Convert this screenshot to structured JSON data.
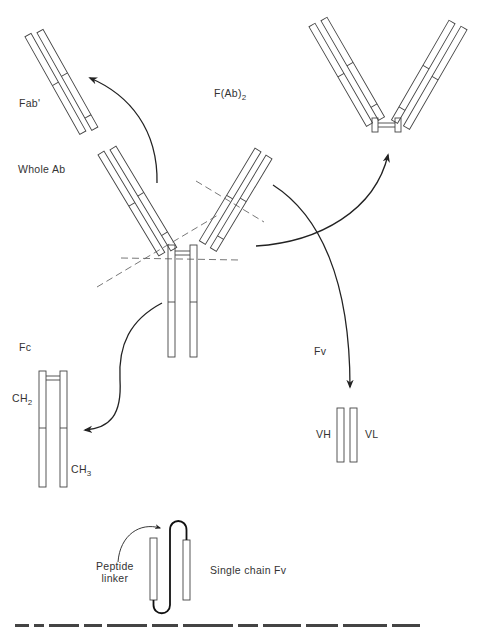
{
  "diagram": {
    "labels": {
      "fab_prime": "Fab'",
      "fab2_main": "F(Ab)",
      "fab2_sub": "2",
      "whole_ab": "Whole Ab",
      "fc": "Fc",
      "ch2_main": "CH",
      "ch2_sub": "2",
      "ch3_main": "CH",
      "ch3_sub": "3",
      "fv": "Fv",
      "vh": "VH",
      "vl": "VL",
      "peptide_linker_line1": "Peptide",
      "peptide_linker_line2": "linker",
      "single_chain_fv": "Single chain Fv"
    },
    "nodes": [
      {
        "id": "whole_ab",
        "label": "Whole Ab"
      },
      {
        "id": "fab_prime",
        "label": "Fab'"
      },
      {
        "id": "fab2",
        "label": "F(Ab)2"
      },
      {
        "id": "fc",
        "label": "Fc",
        "domains": [
          "CH2",
          "CH3"
        ]
      },
      {
        "id": "fv",
        "label": "Fv",
        "domains": [
          "VH",
          "VL"
        ]
      },
      {
        "id": "scfv",
        "label": "Single chain Fv",
        "annotation": "Peptide linker"
      }
    ],
    "edges": [
      {
        "from": "whole_ab",
        "to": "fab_prime"
      },
      {
        "from": "whole_ab",
        "to": "fab2"
      },
      {
        "from": "whole_ab",
        "to": "fc"
      },
      {
        "from": "whole_ab",
        "to": "fv"
      }
    ],
    "colors": {
      "stroke": "#333333",
      "arrow": "#222222",
      "background": "#ffffff"
    },
    "caption_visible": "cropped"
  }
}
